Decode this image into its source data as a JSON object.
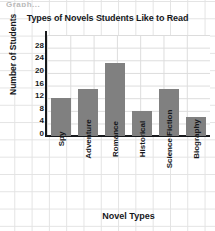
{
  "top_artifact": "Graph...",
  "chart_data": {
    "type": "bar",
    "title": "Types of Novels Students Like to Read",
    "xlabel": "Novel Types",
    "ylabel": "Number of Students",
    "categories": [
      "Spy",
      "Adventure",
      "Romance",
      "Historical",
      "Science Fiction",
      "Biography"
    ],
    "values": [
      12,
      15,
      23,
      8,
      15,
      6
    ],
    "yticks": [
      0,
      4,
      8,
      12,
      16,
      20,
      24,
      28
    ],
    "ylim": [
      0,
      32
    ],
    "grid": true,
    "legend": "none",
    "bar_color": "#808080",
    "axis_color": "#17191c",
    "grid_color": "#dcdcdc"
  }
}
